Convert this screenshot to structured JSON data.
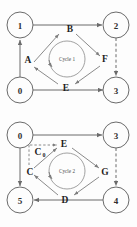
{
  "figure": {
    "panels": [
      {
        "id": "panel-top",
        "cycle_label": "Cycle 1",
        "nodes": [
          {
            "id": "n1",
            "label": "1",
            "position": "top-left"
          },
          {
            "id": "n2",
            "label": "2",
            "position": "top-right"
          },
          {
            "id": "n0",
            "label": "0",
            "position": "bottom-left"
          },
          {
            "id": "n3",
            "label": "3",
            "position": "bottom-right"
          }
        ],
        "edge_labels": [
          {
            "id": "A",
            "label": "A",
            "position": "left"
          },
          {
            "id": "B",
            "label": "B",
            "position": "top"
          },
          {
            "id": "F",
            "label": "F",
            "position": "right"
          },
          {
            "id": "E",
            "label": "E",
            "position": "bottom"
          }
        ],
        "outer_edges": [
          {
            "from": "0",
            "to": "1",
            "style": "solid"
          },
          {
            "from": "1",
            "to": "2",
            "style": "solid"
          },
          {
            "from": "2",
            "to": "3",
            "style": "dashed"
          },
          {
            "from": "0",
            "to": "3",
            "style": "solid"
          }
        ],
        "inner_edges": [
          {
            "from": "A",
            "to": "B",
            "style": "solid"
          },
          {
            "from": "B",
            "to": "F",
            "style": "solid"
          },
          {
            "from": "F",
            "to": "E",
            "style": "solid"
          },
          {
            "from": "E",
            "to": "A",
            "style": "solid"
          }
        ]
      },
      {
        "id": "panel-bottom",
        "cycle_label": "Cycle 2",
        "nodes": [
          {
            "id": "n0b",
            "label": "0",
            "position": "top-left"
          },
          {
            "id": "n3b",
            "label": "3",
            "position": "top-right"
          },
          {
            "id": "n5b",
            "label": "5",
            "position": "bottom-left"
          },
          {
            "id": "n4b",
            "label": "4",
            "position": "bottom-right"
          }
        ],
        "edge_labels": [
          {
            "id": "C0",
            "label": "C",
            "subscript": "0",
            "position": "upper-left"
          },
          {
            "id": "E",
            "label": "E",
            "position": "top"
          },
          {
            "id": "G",
            "label": "G",
            "position": "right"
          },
          {
            "id": "D",
            "label": "D",
            "position": "bottom"
          },
          {
            "id": "C",
            "label": "C",
            "position": "left"
          }
        ],
        "outer_edges": [
          {
            "from": "0",
            "to": "3",
            "style": "solid"
          },
          {
            "from": "0",
            "to": "5",
            "style": "solid"
          },
          {
            "from": "3",
            "to": "4",
            "style": "dashed"
          },
          {
            "from": "4",
            "to": "5",
            "style": "solid"
          }
        ],
        "inner_edges": [
          {
            "from": "C0",
            "to": "E",
            "style": "dashed"
          },
          {
            "from": "E",
            "to": "G",
            "style": "solid"
          },
          {
            "from": "G",
            "to": "D",
            "style": "solid"
          },
          {
            "from": "D",
            "to": "C",
            "style": "solid"
          },
          {
            "from": "C",
            "to": "E",
            "style": "solid"
          }
        ]
      }
    ],
    "colors": {
      "stroke": "#6b6b6b",
      "text": "#1f1f1f",
      "background": "#fdfdfd"
    }
  }
}
